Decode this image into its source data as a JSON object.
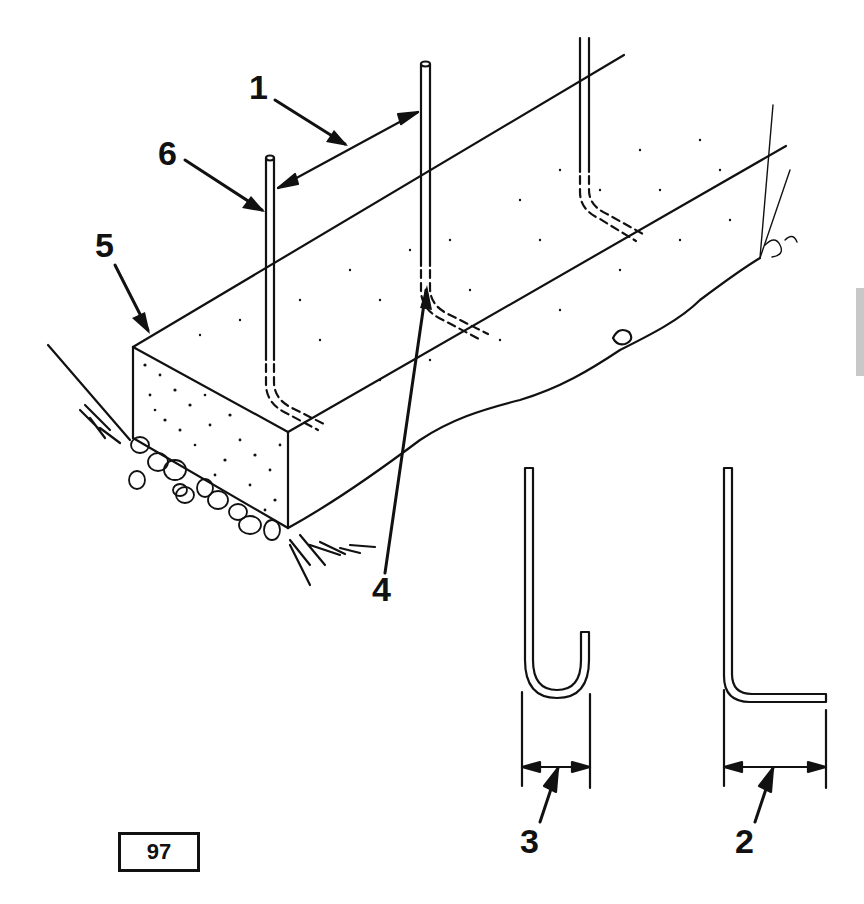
{
  "figure": {
    "number": "97"
  },
  "callouts": [
    {
      "id": "1",
      "label": "1",
      "target": "anchor-bolt-spacing"
    },
    {
      "id": "2",
      "label": "2",
      "target": "l-bolt-leg-length"
    },
    {
      "id": "3",
      "label": "3",
      "target": "j-bolt-hook-width"
    },
    {
      "id": "4",
      "label": "4",
      "target": "embedded-bolt-bend"
    },
    {
      "id": "5",
      "label": "5",
      "target": "footing-top-edge"
    },
    {
      "id": "6",
      "label": "6",
      "target": "anchor-bolt"
    }
  ],
  "colors": {
    "ink": "#111111",
    "paper": "#ffffff",
    "edge_tab": "#c8c8c8"
  }
}
